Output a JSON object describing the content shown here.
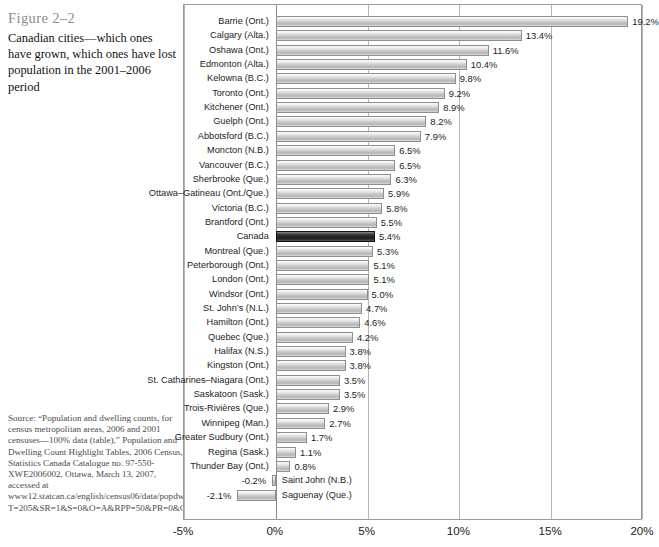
{
  "figure": {
    "number": "Figure 2–2",
    "title": "Canadian cities—which ones have grown, which ones have lost population in the 2001–2006 period"
  },
  "source": {
    "text": "Source: “Population and dwelling counts, for census metropolitan areas, 2006 and 2001 censuses—100% data (table),” Population and Dwelling Count Highlight Tables, 2006 Census, Statistics Canada Catalogue no. 97-550-XWE2006002, Ottawa, March 13, 2007, accessed at www12.statcan.ca/english/census06/data/popdwell/Table.cfm?T=205&SR=1&S=0&O=A&RPP=50&PR=0&CMA=0."
  },
  "colors": {
    "bar_fill": "#c9c9c9",
    "bar_border": "#8f8f8f",
    "highlight_fill": "#1d1d1d",
    "gridline": "#b5b5b5",
    "frame": "#9a9a9a",
    "figure_number": "#8c8c8c"
  },
  "chart_data": {
    "type": "bar",
    "orientation": "horizontal",
    "title": "Canadian cities—which ones have grown, which ones have lost population in the 2001–2006 period",
    "xlabel": "",
    "ylabel": "",
    "xlim": [
      -5,
      20
    ],
    "grid": true,
    "legend": "none",
    "xticks": [
      "-5%",
      "0%",
      "5%",
      "10%",
      "15%",
      "20%"
    ],
    "xtick_values": [
      -5,
      0,
      5,
      10,
      15,
      20
    ],
    "highlight_category": "Canada",
    "categories": [
      "Barrie (Ont.)",
      "Calgary (Alta.)",
      "Oshawa (Ont.)",
      "Edmonton (Alta.)",
      "Kelowna (B.C.)",
      "Toronto (Ont.)",
      "Kitchener (Ont.)",
      "Guelph (Ont.)",
      "Abbotsford (B.C.)",
      "Moncton (N.B.)",
      "Vancouver (B.C.)",
      "Sherbrooke (Que.)",
      "Ottawa–Gatineau (Ont./Que.)",
      "Victoria (B.C.)",
      "Brantford (Ont.)",
      "Canada",
      "Montreal (Que.)",
      "Peterborough (Ont.)",
      "London (Ont.)",
      "Windsor (Ont.)",
      "St. John’s (N.L.)",
      "Hamilton (Ont.)",
      "Quebec (Que.)",
      "Halifax (N.S.)",
      "Kingston (Ont.)",
      "St. Catharines–Niagara (Ont.)",
      "Saskatoon (Sask.)",
      "Trois-Rivières (Que.)",
      "Winnipeg (Man.)",
      "Greater Sudbury (Ont.)",
      "Regina (Sask.)",
      "Thunder Bay (Ont.)",
      "Saint John (N.B.)",
      "Saguenay (Que.)"
    ],
    "values": [
      19.2,
      13.4,
      11.6,
      10.4,
      9.8,
      9.2,
      8.9,
      8.2,
      7.9,
      6.5,
      6.5,
      6.3,
      5.9,
      5.8,
      5.5,
      5.4,
      5.3,
      5.1,
      5.1,
      5.0,
      4.7,
      4.6,
      4.2,
      3.8,
      3.8,
      3.5,
      3.5,
      2.9,
      2.7,
      1.7,
      1.1,
      0.8,
      -0.2,
      -2.1
    ],
    "value_labels": [
      "19.2%",
      "13.4%",
      "11.6%",
      "10.4%",
      "9.8%",
      "9.2%",
      "8.9%",
      "8.2%",
      "7.9%",
      "6.5%",
      "6.5%",
      "6.3%",
      "5.9%",
      "5.8%",
      "5.5%",
      "5.4%",
      "5.3%",
      "5.1%",
      "5.1%",
      "5.0%",
      "4.7%",
      "4.6%",
      "4.2%",
      "3.8%",
      "3.8%",
      "3.5%",
      "3.5%",
      "2.9%",
      "2.7%",
      "1.7%",
      "1.1%",
      "0.8%",
      "-0.2%",
      "-2.1%"
    ]
  }
}
